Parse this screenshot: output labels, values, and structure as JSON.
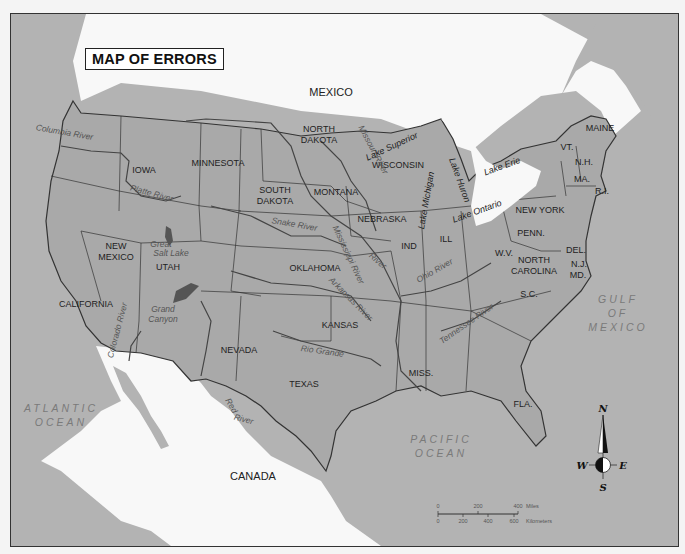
{
  "title": "MAP OF ERRORS",
  "countries": [
    {
      "name": "MEXICO",
      "x": 330,
      "y": 95
    },
    {
      "name": "CANADA",
      "x": 252,
      "y": 479
    }
  ],
  "oceans": [
    {
      "lines": [
        "ATLANTIC",
        "OCEAN"
      ],
      "x": 60,
      "y": 411
    },
    {
      "lines": [
        "PACIFIC",
        "OCEAN"
      ],
      "x": 440,
      "y": 442
    },
    {
      "lines": [
        "GULF",
        "OF",
        "MEXICO"
      ],
      "x": 617,
      "y": 302
    }
  ],
  "states": [
    {
      "name": "NORTH",
      "x": 318,
      "y": 131
    },
    {
      "name": "DAKOTA",
      "x": 318,
      "y": 142
    },
    {
      "name": "MINNESOTA",
      "x": 217,
      "y": 165
    },
    {
      "name": "IOWA",
      "x": 143,
      "y": 172
    },
    {
      "name": "SOUTH",
      "x": 274,
      "y": 192
    },
    {
      "name": "DAKOTA",
      "x": 274,
      "y": 203
    },
    {
      "name": "MONTANA",
      "x": 335,
      "y": 194
    },
    {
      "name": "WISCONSIN",
      "x": 397,
      "y": 167
    },
    {
      "name": "NEBRASKA",
      "x": 381,
      "y": 221
    },
    {
      "name": "NEW YORK",
      "x": 539,
      "y": 212
    },
    {
      "name": "MAINE",
      "x": 599,
      "y": 130
    },
    {
      "name": "VT.",
      "x": 566,
      "y": 149
    },
    {
      "name": "N.H.",
      "x": 583,
      "y": 164
    },
    {
      "name": "MA.",
      "x": 581,
      "y": 181
    },
    {
      "name": "R.I.",
      "x": 601,
      "y": 193
    },
    {
      "name": "PENN.",
      "x": 530,
      "y": 235
    },
    {
      "name": "DEL.",
      "x": 575,
      "y": 252
    },
    {
      "name": "N.J.",
      "x": 578,
      "y": 266
    },
    {
      "name": "MD.",
      "x": 577,
      "y": 277
    },
    {
      "name": "IND",
      "x": 408,
      "y": 248
    },
    {
      "name": "ILL",
      "x": 445,
      "y": 241
    },
    {
      "name": "W.V.",
      "x": 503,
      "y": 255
    },
    {
      "name": "NORTH",
      "x": 533,
      "y": 262
    },
    {
      "name": "CAROLINA",
      "x": 533,
      "y": 273
    },
    {
      "name": "NEW",
      "x": 115,
      "y": 248
    },
    {
      "name": "MEXICO",
      "x": 115,
      "y": 259
    },
    {
      "name": "UTAH",
      "x": 167,
      "y": 269
    },
    {
      "name": "OKLAHOMA",
      "x": 314,
      "y": 270
    },
    {
      "name": "S.C.",
      "x": 528,
      "y": 296
    },
    {
      "name": "CALIFORNIA",
      "x": 85,
      "y": 306
    },
    {
      "name": "KANSAS",
      "x": 339,
      "y": 327
    },
    {
      "name": "NEVADA",
      "x": 238,
      "y": 352
    },
    {
      "name": "TEXAS",
      "x": 303,
      "y": 386
    },
    {
      "name": "MISS.",
      "x": 420,
      "y": 375
    },
    {
      "name": "FLA.",
      "x": 522,
      "y": 406
    }
  ],
  "features": [
    {
      "name": "Great",
      "x": 160,
      "y": 246
    },
    {
      "name": "Salt Lake",
      "x": 170,
      "y": 255
    },
    {
      "name": "Grand",
      "x": 162,
      "y": 311
    },
    {
      "name": "Canyon",
      "x": 162,
      "y": 321
    }
  ],
  "rivers": [
    {
      "name": "Columbia River",
      "x": 63,
      "y": 134,
      "rot": 10
    },
    {
      "name": "Platte River",
      "x": 150,
      "y": 195,
      "rot": 15
    },
    {
      "name": "Snake River",
      "x": 293,
      "y": 226,
      "rot": 10
    },
    {
      "name": "Missouri River",
      "x": 370,
      "y": 150,
      "rot": 62
    },
    {
      "name": "Mississippi River",
      "x": 345,
      "y": 255,
      "rot": 65
    },
    {
      "name": "River",
      "x": 375,
      "y": 262,
      "rot": 40
    },
    {
      "name": "Ohio River",
      "x": 435,
      "y": 272,
      "rot": -30
    },
    {
      "name": "Arkansas River",
      "x": 348,
      "y": 300,
      "rot": 45
    },
    {
      "name": "Rio Grande",
      "x": 321,
      "y": 353,
      "rot": 8
    },
    {
      "name": "Tennessee River",
      "x": 467,
      "y": 325,
      "rot": -35
    },
    {
      "name": "Colorado River",
      "x": 119,
      "y": 330,
      "rot": -75
    },
    {
      "name": "Red",
      "x": 228,
      "y": 406,
      "rot": 60
    },
    {
      "name": "River",
      "x": 242,
      "y": 421,
      "rot": 15
    }
  ],
  "lakes": [
    {
      "name": "Lake Superior",
      "x": 392,
      "y": 148,
      "rot": -25
    },
    {
      "name": "Lake Michigan",
      "x": 428,
      "y": 200,
      "rot": -80
    },
    {
      "name": "Lake Huron",
      "x": 456,
      "y": 180,
      "rot": 70
    },
    {
      "name": "Lake Erie",
      "x": 502,
      "y": 168,
      "rot": -20
    },
    {
      "name": "Lake Ontario",
      "x": 477,
      "y": 213,
      "rot": -20
    }
  ],
  "scale": {
    "miles_labels": [
      "0",
      "200",
      "400"
    ],
    "miles_unit": "Miles",
    "km_labels": [
      "0",
      "200",
      "400",
      "600"
    ],
    "km_unit": "Kilometers"
  },
  "compass": {
    "n": "N",
    "s": "S",
    "e": "E",
    "w": "W"
  },
  "colors": {
    "land": "#a9a9a9",
    "water": "#b3b3b3",
    "foreign": "#f8f8f8",
    "border": "#333333"
  }
}
